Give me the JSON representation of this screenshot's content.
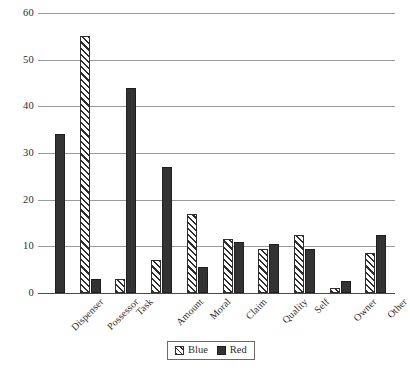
{
  "chart_data": {
    "type": "bar",
    "title": "",
    "subtitle": "",
    "xlabel": "",
    "ylabel": "",
    "ylim": [
      0,
      60
    ],
    "yticks": [
      0,
      10,
      20,
      30,
      40,
      50,
      60
    ],
    "ytick_labels": [
      "0",
      "10",
      "20",
      "30",
      "40",
      "50",
      "60"
    ],
    "grid": true,
    "grid_axis": "y",
    "legend_position": "bottom-center",
    "categories": [
      "Dispenser",
      "Possessor",
      "Task",
      "Amount",
      "Moral",
      "Claim",
      "Quality",
      "Self",
      "Owner",
      "Other"
    ],
    "series": [
      {
        "name": "Blue",
        "pattern": "diagonal-hatch",
        "color": "#ffffff",
        "edge_color": "#2e2e2e",
        "values": [
          0,
          55,
          3,
          7,
          17,
          11.5,
          9.5,
          12.5,
          1,
          8.5
        ]
      },
      {
        "name": "Red",
        "pattern": "solid",
        "color": "#333333",
        "edge_color": "#1f1f1f",
        "values": [
          34,
          3,
          44,
          27,
          5.5,
          11,
          10.5,
          9.5,
          2.5,
          12.5
        ]
      }
    ]
  },
  "legend": {
    "entries": [
      {
        "label": "Blue"
      },
      {
        "label": "Red"
      }
    ]
  }
}
